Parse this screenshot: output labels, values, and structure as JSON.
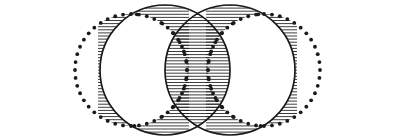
{
  "figure": {
    "canvas": {
      "width": 395,
      "height": 139,
      "background": "#ffffff"
    },
    "stroke_color": "#1a1a1a",
    "hatch_color": "#1a1a1a",
    "dot_color": "#1a1a1a",
    "shapes": [
      {
        "id": "left-dotted-circle",
        "role": "outer-set-left",
        "style": "dotted-outline",
        "cx": 131,
        "cy": 70,
        "r": 56,
        "stroke_width": 1.2,
        "dot_radius": 1.9,
        "dot_count": 44
      },
      {
        "id": "right-dotted-circle",
        "role": "outer-set-right",
        "style": "dotted-outline",
        "cx": 264,
        "cy": 70,
        "r": 56,
        "stroke_width": 1.2,
        "dot_radius": 1.9,
        "dot_count": 44
      },
      {
        "id": "left-solid-circle",
        "role": "inner-set-left",
        "style": "solid-outline",
        "cx": 165,
        "cy": 70,
        "r": 65,
        "stroke_width": 1.7
      },
      {
        "id": "right-solid-circle",
        "role": "inner-set-right",
        "style": "solid-outline",
        "cx": 230,
        "cy": 70,
        "r": 65,
        "stroke_width": 1.7
      }
    ],
    "hatched_regions": [
      {
        "id": "left-crescent-hatch",
        "role": "left-difference-region",
        "description": "crescent between left solid circle left arc and left dotted circle right arc",
        "hatch_orientation": "horizontal",
        "hatch_spacing": 3.1,
        "hatch_width": 0.85,
        "terminal_dots": true
      },
      {
        "id": "center-lens-hatch",
        "role": "intersection-region",
        "description": "vesica piscis formed by the two solid circles",
        "hatch_orientation": "horizontal",
        "hatch_spacing": 3.1,
        "hatch_width": 0.85,
        "terminal_dots": false
      },
      {
        "id": "right-crescent-hatch",
        "role": "right-difference-region",
        "description": "crescent between right solid circle right arc and right dotted circle left arc",
        "hatch_orientation": "horizontal",
        "hatch_spacing": 3.1,
        "hatch_width": 0.85,
        "terminal_dots": true
      }
    ],
    "intersection_points": {
      "solid_circles_top": {
        "x": 197,
        "y": 19
      },
      "solid_circles_bottom": {
        "x": 197,
        "y": 122
      }
    },
    "extents": {
      "leftmost_x": 22,
      "rightmost_x": 373,
      "topmost_y": 5,
      "bottommost_y": 135
    }
  }
}
